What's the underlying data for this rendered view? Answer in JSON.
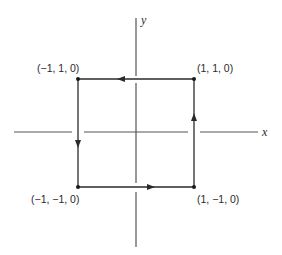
{
  "diagram": {
    "type": "closed square path in the xy-plane with coordinate axes",
    "axes": {
      "x_label": "x",
      "y_label": "y"
    },
    "vertices": [
      {
        "id": "top-left",
        "label": "(−1, 1, 0)"
      },
      {
        "id": "top-right",
        "label": "(1, 1, 0)"
      },
      {
        "id": "bottom-left",
        "label": "(−1, −1, 0)"
      },
      {
        "id": "bottom-right",
        "label": "(1, −1, 0)"
      }
    ],
    "path_direction": "counterclockwise",
    "edges": [
      {
        "from": "(1, −1, 0)",
        "to": "(1, 1, 0)",
        "arrow": "up"
      },
      {
        "from": "(1, 1, 0)",
        "to": "(−1, 1, 0)",
        "arrow": "left"
      },
      {
        "from": "(−1, 1, 0)",
        "to": "(−1, −1, 0)",
        "arrow": "down"
      },
      {
        "from": "(−1, −1, 0)",
        "to": "(1, −1, 0)",
        "arrow": "right"
      }
    ],
    "colors": {
      "line": "#2a2a2a",
      "axis": "#555555",
      "background": "#ffffff"
    }
  }
}
